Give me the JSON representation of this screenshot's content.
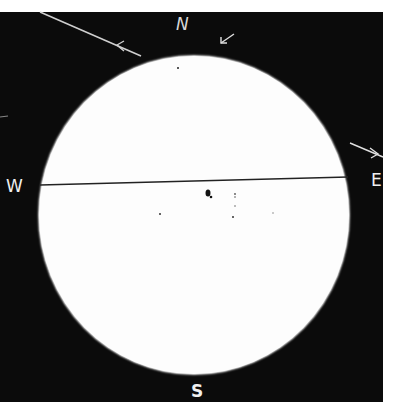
{
  "drawing": {
    "title": "Sunspot drawing",
    "background_color": "#0b0b0b",
    "disk_color": "#fdfdfd",
    "line_color": "#cccccc"
  },
  "compass": {
    "north": "N",
    "south": "S",
    "east": "E",
    "west": "W"
  },
  "markings": {
    "equator_line": {
      "x1": 40,
      "y1": 185,
      "x2": 348,
      "y2": 177
    },
    "axis_line_top_left": {
      "x1": 40,
      "y1": 12,
      "x2": 140,
      "y2": 55
    },
    "axis_line_right": {
      "x1": 350,
      "y1": 143,
      "x2": 383,
      "y2": 157
    }
  },
  "sunspots": [
    {
      "x": 178,
      "y": 68,
      "r": 1
    },
    {
      "x": 208,
      "y": 193,
      "r": 2.5
    },
    {
      "x": 235,
      "y": 194,
      "r": 1
    },
    {
      "x": 235,
      "y": 206,
      "r": 0.8
    },
    {
      "x": 233,
      "y": 216,
      "r": 1
    },
    {
      "x": 160,
      "y": 214,
      "r": 1
    },
    {
      "x": 273,
      "y": 213,
      "r": 0.8
    }
  ]
}
